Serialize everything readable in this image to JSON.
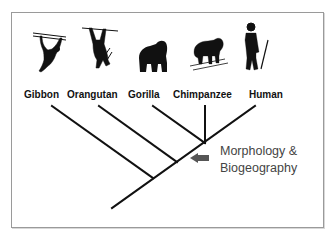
{
  "diagram": {
    "type": "phylogenetic-tree",
    "taxa": [
      {
        "label": "Gibbon",
        "icon": "gibbon-silhouette-icon"
      },
      {
        "label": "Orangutan",
        "icon": "orangutan-silhouette-icon"
      },
      {
        "label": "Gorilla",
        "icon": "gorilla-silhouette-icon"
      },
      {
        "label": "Chimpanzee",
        "icon": "chimpanzee-silhouette-icon"
      },
      {
        "label": "Human",
        "icon": "human-silhouette-icon"
      }
    ],
    "annotation": {
      "line1": "Morphology &",
      "line2": "Biogeography",
      "arrow_color": "#555555"
    },
    "colors": {
      "line": "#111111",
      "silhouette": "#111111",
      "border": "#9a9a9a",
      "annotation_text": "#444444"
    }
  }
}
